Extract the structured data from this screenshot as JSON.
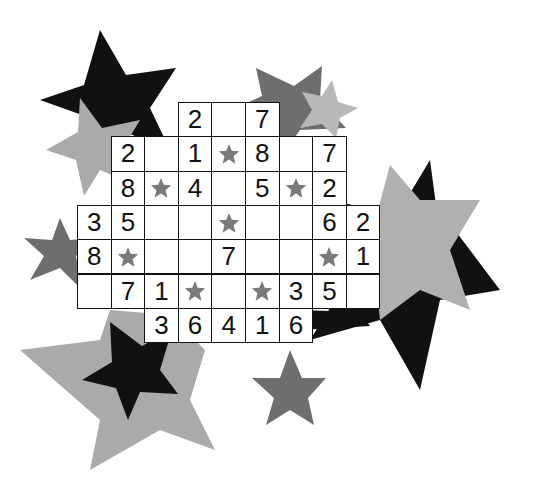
{
  "puzzle": {
    "type": "star-number-grid",
    "colors": {
      "black": "#111111",
      "dark_gray": "#6e6e6e",
      "mid_gray": "#8c8c8c",
      "light_gray": "#b0b0b0",
      "cell_star": "#7a7a7a",
      "cell_bg": "#ffffff"
    },
    "rows": [
      {
        "row": 0,
        "start_col": 3,
        "cells": [
          "2",
          "",
          "7"
        ]
      },
      {
        "row": 1,
        "start_col": 1,
        "cells": [
          "2",
          "",
          "1",
          "*",
          "8",
          "",
          "7"
        ]
      },
      {
        "row": 2,
        "start_col": 1,
        "cells": [
          "8",
          "*",
          "4",
          "",
          "5",
          "*",
          "2"
        ]
      },
      {
        "row": 3,
        "start_col": 0,
        "cells": [
          "3",
          "5",
          "",
          "",
          "*",
          "",
          "",
          "6",
          "2"
        ]
      },
      {
        "row": 4,
        "start_col": 0,
        "cells": [
          "8",
          "*",
          "",
          "",
          "7",
          "",
          "",
          "*",
          "1"
        ]
      },
      {
        "row": 5,
        "start_col": 0,
        "cells": [
          "",
          "7",
          "1",
          "*",
          "",
          "*",
          "3",
          "5",
          ""
        ]
      },
      {
        "row": 6,
        "start_col": 2,
        "cells": [
          "3",
          "6",
          "4",
          "1",
          "6"
        ]
      }
    ]
  }
}
